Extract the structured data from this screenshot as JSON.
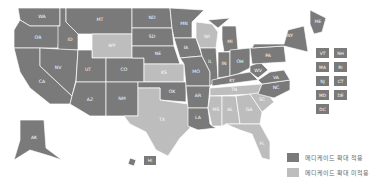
{
  "map": {
    "colors": {
      "expanded": "#7a7a7a",
      "not_expanded": "#bdbdbd"
    },
    "states": [
      {
        "abbr": "WA",
        "status": "expanded"
      },
      {
        "abbr": "OR",
        "status": "expanded"
      },
      {
        "abbr": "CA",
        "status": "expanded"
      },
      {
        "abbr": "ID",
        "status": "expanded"
      },
      {
        "abbr": "NV",
        "status": "expanded"
      },
      {
        "abbr": "MT",
        "status": "expanded"
      },
      {
        "abbr": "WY",
        "status": "not_expanded"
      },
      {
        "abbr": "UT",
        "status": "expanded"
      },
      {
        "abbr": "AZ",
        "status": "expanded"
      },
      {
        "abbr": "CO",
        "status": "expanded"
      },
      {
        "abbr": "NM",
        "status": "expanded"
      },
      {
        "abbr": "ND",
        "status": "expanded"
      },
      {
        "abbr": "SD",
        "status": "expanded"
      },
      {
        "abbr": "NE",
        "status": "expanded"
      },
      {
        "abbr": "KS",
        "status": "not_expanded"
      },
      {
        "abbr": "OK",
        "status": "expanded"
      },
      {
        "abbr": "TX",
        "status": "not_expanded"
      },
      {
        "abbr": "MN",
        "status": "expanded"
      },
      {
        "abbr": "IA",
        "status": "expanded"
      },
      {
        "abbr": "MO",
        "status": "expanded"
      },
      {
        "abbr": "AR",
        "status": "expanded"
      },
      {
        "abbr": "LA",
        "status": "expanded"
      },
      {
        "abbr": "WI",
        "status": "not_expanded"
      },
      {
        "abbr": "IL",
        "status": "expanded"
      },
      {
        "abbr": "MI",
        "status": "expanded"
      },
      {
        "abbr": "IN",
        "status": "expanded"
      },
      {
        "abbr": "OH",
        "status": "expanded"
      },
      {
        "abbr": "KY",
        "status": "expanded"
      },
      {
        "abbr": "TN",
        "status": "not_expanded"
      },
      {
        "abbr": "MS",
        "status": "not_expanded"
      },
      {
        "abbr": "AL",
        "status": "not_expanded"
      },
      {
        "abbr": "GA",
        "status": "not_expanded"
      },
      {
        "abbr": "FL",
        "status": "not_expanded"
      },
      {
        "abbr": "SC",
        "status": "not_expanded"
      },
      {
        "abbr": "NC",
        "status": "expanded"
      },
      {
        "abbr": "VA",
        "status": "expanded"
      },
      {
        "abbr": "WV",
        "status": "expanded"
      },
      {
        "abbr": "PA",
        "status": "expanded"
      },
      {
        "abbr": "NY",
        "status": "expanded"
      },
      {
        "abbr": "ME",
        "status": "expanded"
      },
      {
        "abbr": "AK",
        "status": "expanded"
      },
      {
        "abbr": "HI",
        "status": "expanded"
      }
    ],
    "small_state_boxes": [
      {
        "abbr": "VT",
        "status": "expanded"
      },
      {
        "abbr": "NH",
        "status": "expanded"
      },
      {
        "abbr": "MA",
        "status": "expanded"
      },
      {
        "abbr": "RI",
        "status": "expanded"
      },
      {
        "abbr": "NJ",
        "status": "expanded"
      },
      {
        "abbr": "CT",
        "status": "expanded"
      },
      {
        "abbr": "MD",
        "status": "expanded"
      },
      {
        "abbr": "DE",
        "status": "expanded"
      },
      {
        "abbr": "DC",
        "status": "expanded"
      }
    ]
  },
  "legend": {
    "expanded_label": "메디케이드 확대 적용",
    "not_expanded_label": "메디케이드 확대 미적용"
  }
}
